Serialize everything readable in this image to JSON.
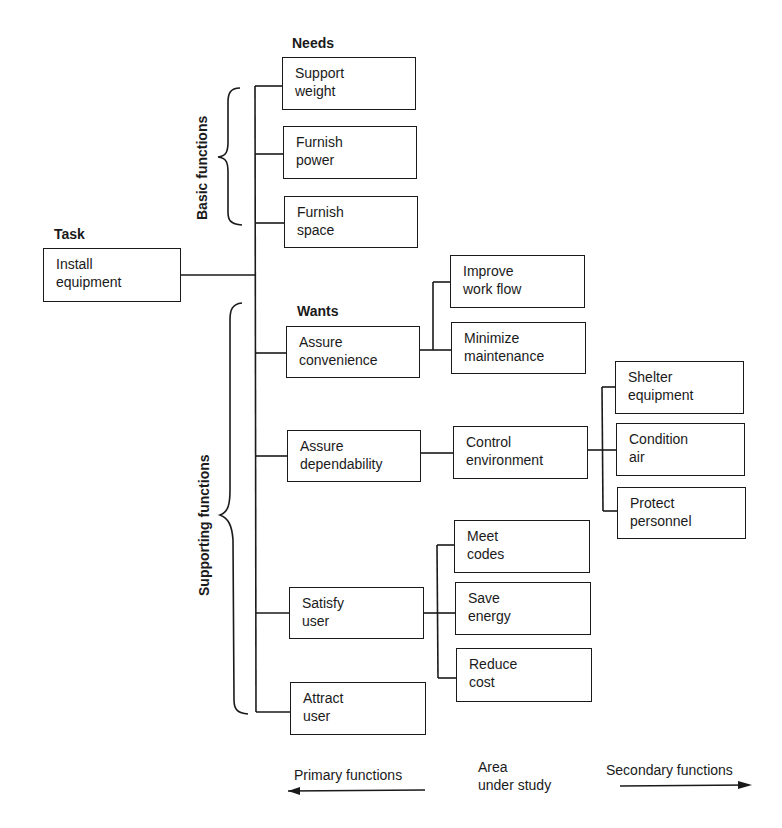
{
  "headers": {
    "task": "Task",
    "needs": "Needs",
    "wants": "Wants"
  },
  "brackets": {
    "basic": "Basic functions",
    "supporting": "Supporting functions"
  },
  "task": {
    "line1": "Install",
    "line2": "equipment"
  },
  "needs": [
    {
      "line1": "Support",
      "line2": "weight"
    },
    {
      "line1": "Furnish",
      "line2": "power"
    },
    {
      "line1": "Furnish",
      "line2": "space"
    }
  ],
  "wants": [
    {
      "line1": "Assure",
      "line2": "convenience"
    },
    {
      "line1": "Assure",
      "line2": "dependability"
    },
    {
      "line1": "Satisfy",
      "line2": "user"
    },
    {
      "line1": "Attract",
      "line2": "user"
    }
  ],
  "convenience_children": [
    {
      "line1": "Improve",
      "line2": "work flow"
    },
    {
      "line1": "Minimize",
      "line2": "maintenance"
    }
  ],
  "dependability_children": [
    {
      "line1": "Control",
      "line2": "environment"
    }
  ],
  "environment_children": [
    {
      "line1": "Shelter",
      "line2": "equipment"
    },
    {
      "line1": "Condition",
      "line2": "air"
    },
    {
      "line1": "Protect",
      "line2": "personnel"
    }
  ],
  "satisfy_children": [
    {
      "line1": "Meet",
      "line2": "codes"
    },
    {
      "line1": "Save",
      "line2": "energy"
    },
    {
      "line1": "Reduce",
      "line2": "cost"
    }
  ],
  "footer": {
    "primary": "Primary functions",
    "area_line1": "Area",
    "area_line2": "under study",
    "secondary": "Secondary functions"
  }
}
